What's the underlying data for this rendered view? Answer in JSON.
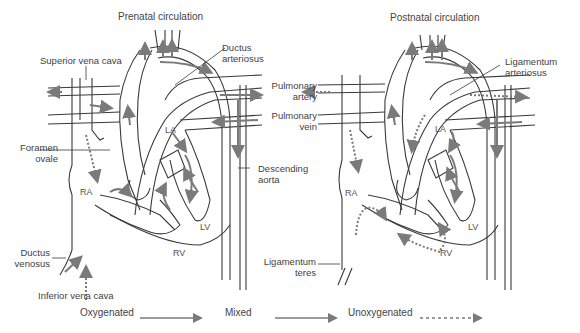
{
  "prenatal": {
    "title": "Prenatal circulation",
    "labels": {
      "superior_vena_cava": "Superior vena cava",
      "ductus_arteriosus_1": "Ductus",
      "ductus_arteriosus_2": "arteriosus",
      "foramen_ovale_1": "Foramen",
      "foramen_ovale_2": "ovale",
      "ductus_venosus_1": "Ductus",
      "ductus_venosus_2": "venosus",
      "inferior_vena_cava": "Inferior vena cava",
      "descending_aorta_1": "Descending",
      "descending_aorta_2": "aorta"
    },
    "chambers": {
      "la": "LA",
      "ra": "RA",
      "lv": "LV",
      "rv": "RV"
    }
  },
  "shared_labels": {
    "pulmonary_artery_1": "Pulmonary",
    "pulmonary_artery_2": "artery",
    "pulmonary_vein_1": "Pulmonary",
    "pulmonary_vein_2": "vein"
  },
  "postnatal": {
    "title": "Postnatal circulation",
    "labels": {
      "ligamentum_arteriosus_1": "Ligamentum",
      "ligamentum_arteriosus_2": "arteriosus",
      "ligamentum_teres_1": "Ligamentum",
      "ligamentum_teres_2": "teres"
    },
    "chambers": {
      "la": "LA",
      "ra": "RA",
      "lv": "LV",
      "rv": "RV"
    }
  },
  "legend": {
    "oxygenated": "Oxygenated",
    "mixed": "Mixed",
    "unoxygenated": "Unoxygenated"
  },
  "colors": {
    "line": "#3a3a3a",
    "arrow": "#7a7a7a",
    "text": "#444444"
  }
}
